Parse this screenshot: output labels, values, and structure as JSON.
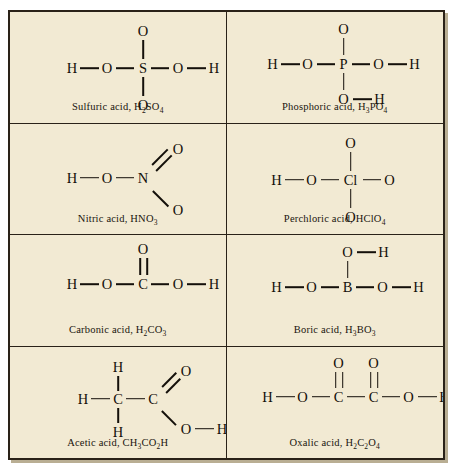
{
  "figure": {
    "background_color": "#f2ead3",
    "border_color": "#2a2218",
    "bond_color": "#14100a",
    "columns": 2,
    "rows": 4
  },
  "cells": [
    {
      "id": "sulfuric-acid",
      "name": "Sulfuric acid",
      "formula_html": "H<sub>2</sub>SO<sub>4</sub>",
      "caption": "Sulfuric acid, H2SO4",
      "center_atom": "S",
      "atoms": [
        "H",
        "O",
        "S",
        "O",
        "H",
        "O",
        "O"
      ],
      "layout": "center-cross",
      "bonds": [
        "H-O single",
        "O-S single",
        "S-O single",
        "O-H single",
        "S-O up single",
        "S-O down single"
      ]
    },
    {
      "id": "phosphoric-acid",
      "name": "Phosphoric acid",
      "formula_html": "H<sub>3</sub>PO<sub>4</sub>",
      "caption": "Phosphoric acid, H3PO4",
      "center_atom": "P",
      "atoms": [
        "H",
        "O",
        "P",
        "O",
        "H",
        "O",
        "O",
        "H"
      ],
      "layout": "center-cross-oh-bottom",
      "bonds": [
        "H-O single",
        "O-P single",
        "P-O single",
        "O-H single",
        "P-O up single",
        "P-O down single",
        "O-H bottom single"
      ]
    },
    {
      "id": "nitric-acid",
      "name": "Nitric acid",
      "formula_html": "HNO<sub>3</sub>",
      "caption": "Nitric acid, HNO3",
      "center_atom": "N",
      "atoms": [
        "H",
        "O",
        "N",
        "O",
        "O"
      ],
      "layout": "diagonal-pair",
      "bonds": [
        "H-O single",
        "O-N single",
        "N=O diagonal double up-right",
        "N-O diagonal single down-right"
      ]
    },
    {
      "id": "perchloric-acid",
      "name": "Perchloric acid",
      "formula_html": "HClO<sub>4</sub>",
      "caption": "Perchloric acid, HClO4",
      "center_atom": "Cl",
      "atoms": [
        "H",
        "O",
        "Cl",
        "O",
        "O",
        "O"
      ],
      "layout": "center-cross",
      "bonds": [
        "H-O single",
        "O-Cl single",
        "Cl-O single",
        "Cl-O up single",
        "Cl-O down single"
      ]
    },
    {
      "id": "carbonic-acid",
      "name": "Carbonic acid",
      "formula_html": "H<sub>2</sub>CO<sub>3</sub>",
      "caption": "Carbonic acid, H2CO3",
      "center_atom": "C",
      "atoms": [
        "H",
        "O",
        "C",
        "O",
        "H",
        "O"
      ],
      "layout": "center-double-up",
      "bonds": [
        "H-O single",
        "O-C single",
        "C-O single",
        "O-H single",
        "C=O up double"
      ]
    },
    {
      "id": "boric-acid",
      "name": "Boric acid",
      "formula_html": "H<sub>3</sub>BO<sub>3</sub>",
      "caption": "Boric acid, H3BO3",
      "center_atom": "B",
      "atoms": [
        "H",
        "O",
        "B",
        "O",
        "H",
        "O",
        "H"
      ],
      "layout": "center-oh-up",
      "bonds": [
        "H-O single",
        "O-B single",
        "B-O single",
        "O-H single",
        "B-O up single",
        "O-H top single"
      ]
    },
    {
      "id": "acetic-acid",
      "name": "Acetic acid",
      "formula_html": "CH<sub>3</sub>CO<sub>2</sub>H",
      "caption": "Acetic acid, CH3CO2H",
      "center_atom": "C",
      "atoms": [
        "H",
        "H",
        "C",
        "H",
        "C",
        "O",
        "O",
        "H"
      ],
      "layout": "methyl-carboxyl",
      "bonds": [
        "H-C left single",
        "H-C up single",
        "H-C down single",
        "C-C single",
        "C=O diagonal double up-right",
        "C-O diagonal single down-right",
        "O-H single"
      ]
    },
    {
      "id": "oxalic-acid",
      "name": "Oxalic acid",
      "formula_html": "H<sub>2</sub>C<sub>2</sub>O<sub>4</sub>",
      "caption": "Oxalic acid, H2C2O4",
      "center_atom": "C",
      "atoms": [
        "H",
        "O",
        "C",
        "C",
        "O",
        "H",
        "O",
        "O"
      ],
      "layout": "dicarboxyl",
      "bonds": [
        "H-O single",
        "O-C single",
        "C-C single",
        "C-O single",
        "O-H single",
        "C=O up double",
        "C=O up double"
      ]
    }
  ]
}
